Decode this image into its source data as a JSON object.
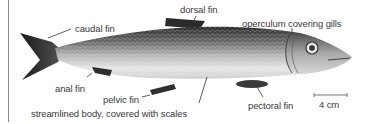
{
  "figure": {
    "labels": {
      "caudal_fin": "caudal fin",
      "dorsal_fin": "dorsal fin",
      "operculum": "operculum covering gills",
      "anal_fin": "anal fin",
      "pelvic_fin": "pelvic fin",
      "body": "streamlined body, covered with scales",
      "pectoral_fin": "pectoral fin"
    },
    "scale_bar": {
      "label": "4 cm"
    }
  },
  "colors": {
    "label_text": "#3a3a3a",
    "leader_line": "#333333",
    "fish_dark": "#2a2a2a",
    "fish_mid": "#8c8c8c",
    "fish_belly": "#ececec",
    "frame_line": "#8a8a8a"
  }
}
